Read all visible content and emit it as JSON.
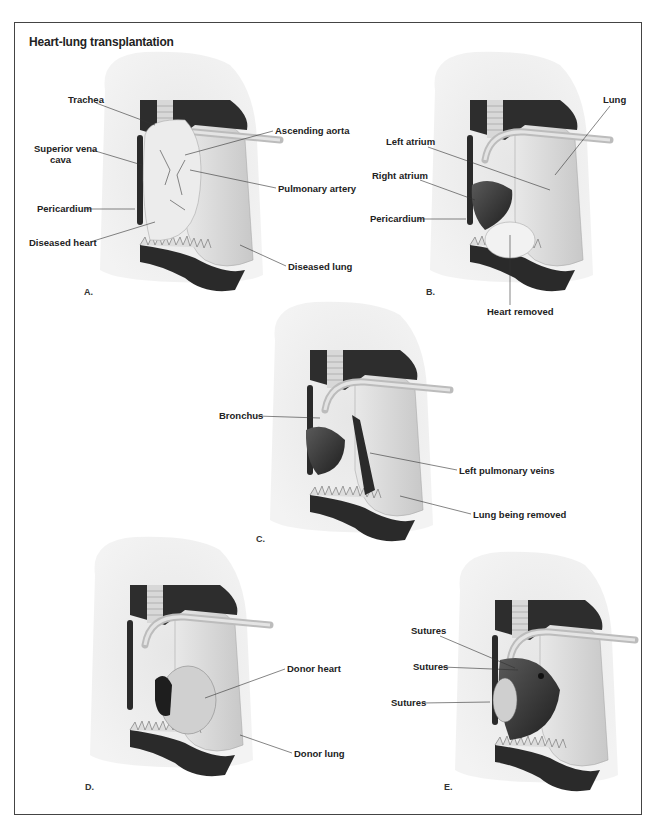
{
  "title": "Heart-lung transplantation",
  "panels": {
    "A": {
      "letter": "A.",
      "labels": [
        "Trachea",
        "Superior vena",
        "cava",
        "Pericardium",
        "Diseased heart",
        "Ascending aorta",
        "Pulmonary artery",
        "Diseased lung"
      ]
    },
    "B": {
      "letter": "B.",
      "labels": [
        "Left atrium",
        "Right atrium",
        "Pericardium",
        "Lung",
        "Heart removed"
      ]
    },
    "C": {
      "letter": "C.",
      "labels": [
        "Bronchus",
        "Left pulmonary veins",
        "Lung being removed"
      ]
    },
    "D": {
      "letter": "D.",
      "labels": [
        "Donor heart",
        "Donor lung"
      ]
    },
    "E": {
      "letter": "E.",
      "labels": [
        "Sutures",
        "Sutures",
        "Sutures"
      ]
    }
  },
  "colors": {
    "frame": "#444444",
    "shadow": "#ececec",
    "tissue_dark": "#2a2a2a",
    "tissue_mid": "#9a9a9a",
    "tissue_light": "#d8d8d8",
    "label": "#222222"
  }
}
